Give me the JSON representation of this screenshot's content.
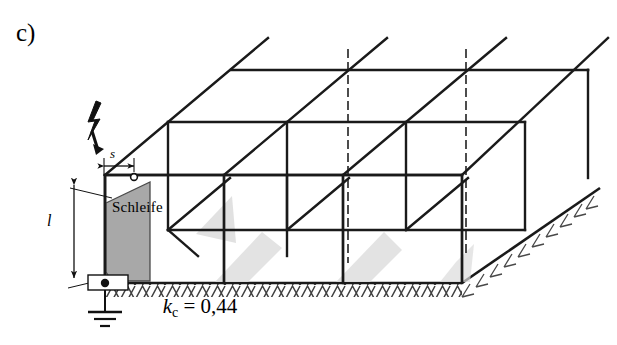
{
  "figure": {
    "panel_label": "c)",
    "caption": {
      "symbol": "k",
      "subscript": "c",
      "relation": "=",
      "value": "0,44",
      "full_text": "kc = 0,44"
    },
    "annotations": {
      "loop_label": "Schleife",
      "separation_distance_label": "s",
      "loop_length_label": "l"
    },
    "icons": {
      "lightning_strike": "lightning-bolt-icon",
      "earth_ground": "ground-earth-icon",
      "terminal_point": "terminal-dot-icon"
    },
    "colors": {
      "line": "#1a1a1a",
      "loop_fill": "#a8a8a8",
      "shadow_fill": "#d9d9d9",
      "hatch": "#4a4a4a",
      "background": "#ffffff"
    },
    "geometry": {
      "bays_front": 3,
      "bays_depth": 2,
      "hidden_line_style": "dashed",
      "projection": "isometric"
    }
  }
}
